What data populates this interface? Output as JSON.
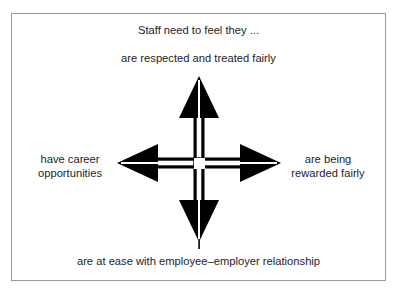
{
  "figure": {
    "type": "four-way-arrow-diagram",
    "heading": "Staff need to feel they ...",
    "subheading": "are respected and treated fairly",
    "labels": {
      "top": "are respected and treated fairly",
      "bottom": "are at ease with employee–employer relationship",
      "left_line_1": "have career",
      "left_line_2": "opportunities",
      "right_line_1": "are being",
      "right_line_2": "rewarded fairly"
    },
    "arrows": [
      {
        "direction": "up",
        "name": "arrow-up",
        "points_to": "are respected and treated fairly"
      },
      {
        "direction": "right",
        "name": "arrow-right",
        "points_to": "are being rewarded fairly"
      },
      {
        "direction": "down",
        "name": "arrow-down",
        "points_to": "are at ease with employee–employer relationship"
      },
      {
        "direction": "left",
        "name": "arrow-left",
        "points_to": "have career opportunities"
      }
    ],
    "colors": {
      "arrow": "#000000",
      "text": "#1d1d1f",
      "border": "#9a9a9e",
      "background": "#ffffff"
    },
    "scan_remnant": "· · · · · · · · · ·"
  }
}
